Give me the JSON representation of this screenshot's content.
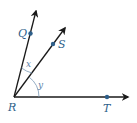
{
  "diagram": {
    "type": "angle-diagram",
    "vertex": {
      "label": "R",
      "x": 14,
      "y": 97
    },
    "rays": [
      {
        "name": "RQ",
        "end": {
          "x": 36,
          "y": 10
        },
        "point": {
          "label": "Q",
          "x": 30,
          "y": 33
        }
      },
      {
        "name": "RS",
        "end": {
          "x": 66,
          "y": 27
        },
        "point": {
          "label": "S",
          "x": 53,
          "y": 44
        }
      },
      {
        "name": "RT",
        "end": {
          "x": 129,
          "y": 97
        },
        "point": {
          "label": "T",
          "x": 107,
          "y": 97
        }
      }
    ],
    "angles": [
      {
        "label": "x",
        "between": [
          "RQ",
          "RS"
        ]
      },
      {
        "label": "y",
        "between": [
          "RS",
          "RT"
        ]
      }
    ],
    "colors": {
      "ray": "#1a1a1a",
      "point": "#2e5f8a",
      "label": "#2e5f8a",
      "arc": "#7a98b5"
    }
  }
}
